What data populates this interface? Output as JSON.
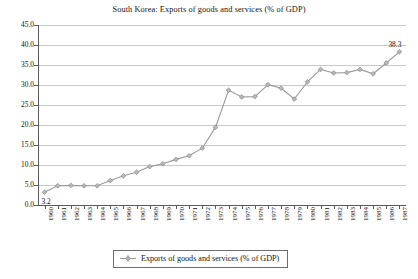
{
  "chart_data": {
    "type": "line",
    "title": "South Korea: Exports of goods and services (% of GDP)",
    "xlabel": "",
    "ylabel": "",
    "ylim": [
      0.0,
      45.0
    ],
    "yticks": [
      "0.0",
      "5.0",
      "10.0",
      "15.0",
      "20.0",
      "25.0",
      "30.0",
      "35.0",
      "40.0",
      "45.0"
    ],
    "ytick_values": [
      0.0,
      5.0,
      10.0,
      15.0,
      20.0,
      25.0,
      30.0,
      35.0,
      40.0,
      45.0
    ],
    "grid": true,
    "legend_position": "bottom",
    "series_name": "Exports of goods and services (% of GDP)",
    "series_color": "#9a9a9a",
    "marker": "diamond",
    "categories": [
      "1960",
      "1961",
      "1962",
      "1963",
      "1964",
      "1965",
      "1966",
      "1967",
      "1968",
      "1969",
      "1970",
      "1971",
      "1972",
      "1973",
      "1974",
      "1975",
      "1976",
      "1977",
      "1978",
      "1979",
      "1980",
      "1981",
      "1982",
      "1983",
      "1984",
      "1985",
      "1986",
      "1987"
    ],
    "values": [
      3.2,
      4.8,
      4.9,
      4.8,
      4.8,
      6.1,
      7.3,
      8.2,
      9.6,
      10.3,
      11.4,
      12.3,
      14.2,
      19.4,
      28.7,
      27.0,
      27.1,
      30.1,
      29.2,
      26.5,
      30.8,
      33.9,
      33.0,
      33.1,
      33.9,
      32.8,
      35.5,
      38.3
    ],
    "point_labels": [
      {
        "category": "1960",
        "value": 3.2,
        "text": "3.2"
      },
      {
        "category": "1987",
        "value": 38.3,
        "text": "38.3"
      }
    ]
  },
  "legend": {
    "entries": [
      {
        "label": "Exports of goods and services (% of GDP)",
        "marker": "diamond-line-marker"
      }
    ]
  }
}
